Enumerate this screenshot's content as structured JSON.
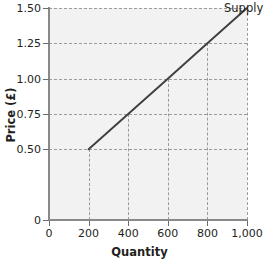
{
  "chart_data": {
    "type": "line",
    "title": "",
    "xlabel": "Quantity",
    "ylabel": "Price (£)",
    "xlim": [
      0,
      1000
    ],
    "ylim": [
      0,
      1.5
    ],
    "grid": "dashed-guides",
    "legend_position": "line-end-top-right",
    "x_ticks": [
      {
        "value": 0,
        "label": "0"
      },
      {
        "value": 200,
        "label": "200"
      },
      {
        "value": 400,
        "label": "400"
      },
      {
        "value": 600,
        "label": "600"
      },
      {
        "value": 800,
        "label": "800"
      },
      {
        "value": 1000,
        "label": "1,000"
      }
    ],
    "y_ticks": [
      {
        "value": 0,
        "label": "0"
      },
      {
        "value": 0.5,
        "label": "0.50"
      },
      {
        "value": 0.75,
        "label": "0.75"
      },
      {
        "value": 1.0,
        "label": "1.00"
      },
      {
        "value": 1.25,
        "label": "1.25"
      },
      {
        "value": 1.5,
        "label": "1.50"
      }
    ],
    "series": [
      {
        "name": "Supply",
        "color": "#3f3f3f",
        "x": [
          200,
          400,
          600,
          800,
          1000
        ],
        "values": [
          0.5,
          0.75,
          1.0,
          1.25,
          1.5
        ]
      }
    ],
    "guide_points": [
      {
        "x": 200,
        "y": 0.5
      },
      {
        "x": 400,
        "y": 0.75
      },
      {
        "x": 600,
        "y": 1.0
      },
      {
        "x": 800,
        "y": 1.25
      },
      {
        "x": 1000,
        "y": 1.5
      }
    ],
    "colors": {
      "plot_background": "#f2f2f2",
      "page_background": "#ffffff",
      "axis": "#898989",
      "gridline": "#9b9b9b",
      "text": "#231f20",
      "series_line": "#3f3f3f"
    }
  }
}
